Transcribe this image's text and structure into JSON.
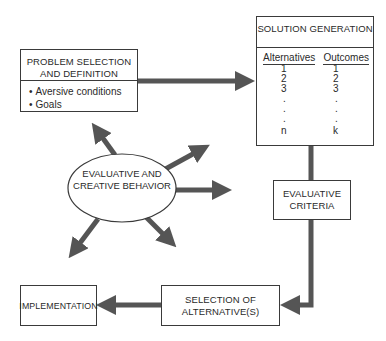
{
  "diagram": {
    "nodes": {
      "problem": {
        "title": "PROBLEM SELECTION AND DEFINITION",
        "items": [
          "Aversive conditions",
          "Goals"
        ]
      },
      "solution": {
        "title": "SOLUTION GENERATION",
        "col_left": "Alternatives",
        "col_right": "Outcomes",
        "alternatives": [
          "1",
          "2",
          "3",
          ".",
          ".",
          ".",
          "n"
        ],
        "outcomes": [
          "1",
          "2",
          "3",
          ".",
          ".",
          ".",
          "k"
        ]
      },
      "center": {
        "label": "EVALUATIVE AND CREATIVE BEHAVIOR"
      },
      "criteria": {
        "title": "EVALUATIVE CRITERIA"
      },
      "selection": {
        "title": "SELECTION OF ALTERNATIVE(S)"
      },
      "implementation": {
        "title": "IMPLEMENTATION"
      }
    },
    "edges": [
      {
        "from": "problem",
        "to": "solution"
      },
      {
        "from": "solution",
        "to": "criteria"
      },
      {
        "from": "criteria",
        "to": "selection"
      },
      {
        "from": "selection",
        "to": "implementation"
      }
    ],
    "colors": {
      "arrow": "#555555",
      "border": "#3a3a3a"
    }
  }
}
